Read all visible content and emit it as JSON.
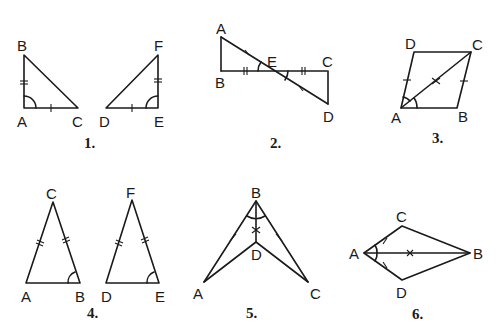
{
  "figures": [
    {
      "number": "1.",
      "vertices": [
        "A",
        "B",
        "C",
        "D",
        "E",
        "F"
      ],
      "description": "Two right triangles ABC and DEF; AB ≅ EF (double tick), AC ≅ DE (single tick), right angles marked at A and E"
    },
    {
      "number": "2.",
      "vertices": [
        "A",
        "B",
        "C",
        "D",
        "E"
      ],
      "description": "Segments AD and BC intersect at E; AE ≅ ED (single tick), BE ≅ EC (double tick), vertical angles at E marked"
    },
    {
      "number": "3.",
      "vertices": [
        "A",
        "B",
        "C",
        "D"
      ],
      "description": "Quadrilateral ABCD with diagonal AC; AD ≅ BC (single tick), AC marked with x, angles DAC and CAB marked"
    },
    {
      "number": "4.",
      "vertices": [
        "A",
        "B",
        "C",
        "D",
        "E",
        "F"
      ],
      "description": "Two isosceles triangles ABC and DEF; AC, BC, DF, EF double ticks; angles at B and E marked"
    },
    {
      "number": "5.",
      "vertices": [
        "A",
        "B",
        "C",
        "D"
      ],
      "description": "Concave figure with BA, BC single ticks, BD marked with x, angles ABD and DBC marked"
    },
    {
      "number": "6.",
      "vertices": [
        "A",
        "B",
        "C",
        "D"
      ],
      "description": "Kite ACBD with diagonal AB; AC ≅ AD (single tick), AB marked with x, angles CAB and BAD marked"
    }
  ],
  "labels": {
    "f1": {
      "A": "A",
      "B": "B",
      "C": "C",
      "D": "D",
      "E": "E",
      "F": "F"
    },
    "f2": {
      "A": "A",
      "B": "B",
      "C": "C",
      "D": "D",
      "E": "E"
    },
    "f3": {
      "A": "A",
      "B": "B",
      "C": "C",
      "D": "D"
    },
    "f4": {
      "A": "A",
      "B": "B",
      "C": "C",
      "D": "D",
      "E": "E",
      "F": "F"
    },
    "f5": {
      "A": "A",
      "B": "B",
      "C": "C",
      "D": "D"
    },
    "f6": {
      "A": "A",
      "B": "B",
      "C": "C",
      "D": "D"
    }
  },
  "numbers": {
    "f1": "1.",
    "f2": "2.",
    "f3": "3.",
    "f4": "4.",
    "f5": "5.",
    "f6": "6."
  }
}
